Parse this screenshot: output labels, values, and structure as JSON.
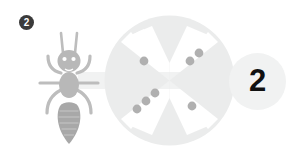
{
  "canvas": {
    "width": 293,
    "height": 160,
    "background": "#ffffff"
  },
  "step_badge": {
    "label": "2",
    "background": "#3a3a3a",
    "text_color": "#ffffff"
  },
  "ant_icon": {
    "name": "ant-icon",
    "color": "#b8b8b8",
    "abdomen_color": "#a8a8a8",
    "segments": [
      "antennae",
      "head",
      "eyes",
      "legs",
      "thorax",
      "abdomen"
    ]
  },
  "wheel": {
    "name": "dotted-wheel",
    "disc_color": "#ebecec",
    "cutout_color": "#ffffff",
    "dot_color": "#b0b0b0",
    "quadrant_dot_counts": {
      "top_left": 1,
      "top_right": 2,
      "bottom_left": 3,
      "bottom_right": 1
    },
    "total_dots": 7
  },
  "connector": {
    "name": "connector-bar",
    "color": "#f1f2f2"
  },
  "value_circle": {
    "label": "2",
    "background": "#f1f2f2",
    "text_color": "#111111"
  }
}
